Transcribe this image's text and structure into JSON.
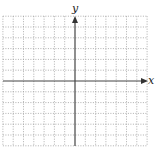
{
  "diagram": {
    "type": "coordinate-plane",
    "x_axis_label": "x",
    "y_axis_label": "y",
    "grid": {
      "cells_left": 7,
      "cells_right": 7,
      "cells_up": 6,
      "cells_down": 6,
      "style": "dotted"
    },
    "colors": {
      "axis": "#444444",
      "grid": "#9a9a9a",
      "background": "#ffffff"
    }
  }
}
